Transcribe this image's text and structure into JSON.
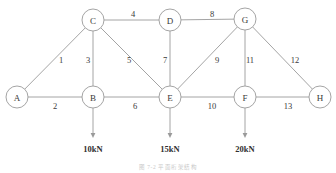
{
  "figure": {
    "type": "truss-diagram",
    "caption": "图 7-2   平面桁架结构",
    "ghost_header": "",
    "colors": {
      "member": "#9a9a9a",
      "node_stroke": "#9a9a9a",
      "node_fill": "#ffffff",
      "text": "#3a3a3a",
      "load": "#9a9a9a",
      "background": "#ffffff"
    }
  },
  "chart_data": {
    "type": "diagram",
    "title": "图 7-2   平面桁架结构",
    "nodes": [
      {
        "id": "A",
        "label": "A",
        "x": 17,
        "y": 97,
        "r": 11
      },
      {
        "id": "B",
        "label": "B",
        "x": 93,
        "y": 97,
        "r": 11
      },
      {
        "id": "C",
        "label": "C",
        "x": 93,
        "y": 20,
        "r": 11
      },
      {
        "id": "D",
        "label": "D",
        "x": 170,
        "y": 20,
        "r": 11
      },
      {
        "id": "E",
        "label": "E",
        "x": 170,
        "y": 97,
        "r": 11
      },
      {
        "id": "F",
        "label": "F",
        "x": 245,
        "y": 97,
        "r": 11
      },
      {
        "id": "G",
        "label": "G",
        "x": 245,
        "y": 19,
        "r": 11
      },
      {
        "id": "H",
        "label": "H",
        "x": 320,
        "y": 97,
        "r": 11
      }
    ],
    "members": [
      {
        "label": "1",
        "from": "A",
        "to": "C",
        "lx": 61,
        "ly": 60
      },
      {
        "label": "2",
        "from": "A",
        "to": "B",
        "lx": 55,
        "ly": 106
      },
      {
        "label": "3",
        "from": "C",
        "to": "B",
        "lx": 88,
        "ly": 60
      },
      {
        "label": "4",
        "from": "C",
        "to": "D",
        "lx": 133,
        "ly": 14
      },
      {
        "label": "5",
        "from": "C",
        "to": "E",
        "lx": 129,
        "ly": 60
      },
      {
        "label": "6",
        "from": "B",
        "to": "E",
        "lx": 135,
        "ly": 106
      },
      {
        "label": "7",
        "from": "D",
        "to": "E",
        "lx": 165,
        "ly": 60
      },
      {
        "label": "8",
        "from": "D",
        "to": "G",
        "lx": 212,
        "ly": 14
      },
      {
        "label": "9",
        "from": "G",
        "to": "E",
        "lx": 217,
        "ly": 60
      },
      {
        "label": "10",
        "from": "E",
        "to": "F",
        "lx": 212,
        "ly": 106
      },
      {
        "label": "11",
        "from": "G",
        "to": "F",
        "lx": 250,
        "ly": 60
      },
      {
        "label": "12",
        "from": "G",
        "to": "H",
        "lx": 295,
        "ly": 60
      },
      {
        "label": "13",
        "from": "F",
        "to": "H",
        "lx": 288,
        "ly": 106
      }
    ],
    "loads": [
      {
        "at": "B",
        "value": "10kN",
        "x": 93,
        "y_start": 108,
        "y_end": 138,
        "label_y": 149
      },
      {
        "at": "E",
        "value": "15kN",
        "x": 170,
        "y_start": 108,
        "y_end": 138,
        "label_y": 149
      },
      {
        "at": "F",
        "value": "20kN",
        "x": 245,
        "y_start": 108,
        "y_end": 138,
        "label_y": 149
      }
    ],
    "member_labels": [
      "1",
      "2",
      "3",
      "4",
      "5",
      "6",
      "7",
      "8",
      "9",
      "10",
      "11",
      "12",
      "13"
    ],
    "node_labels": [
      "A",
      "B",
      "C",
      "D",
      "E",
      "F",
      "G",
      "H"
    ],
    "load_values": [
      "10kN",
      "15kN",
      "20kN"
    ]
  }
}
